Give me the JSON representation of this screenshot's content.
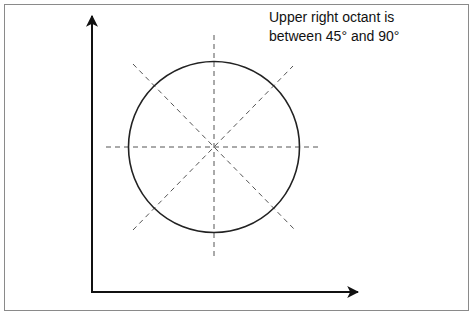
{
  "diagram": {
    "caption_line1": "Upper right octant is",
    "caption_line2": "between 45° and 90°",
    "colors": {
      "frame": "#8a8a8a",
      "axes": "#111111",
      "circle": "#222222",
      "dashed": "#555555"
    },
    "elements": {
      "x_axis": "horizontal arrow",
      "y_axis": "vertical arrow",
      "circle": "circle divided into 8 octants by dashed lines"
    }
  }
}
